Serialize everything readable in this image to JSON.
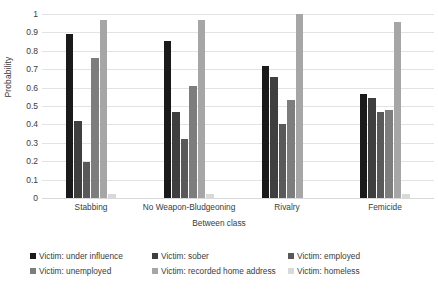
{
  "chart_data": {
    "type": "bar",
    "title": "",
    "xlabel": "Between class",
    "ylabel": "Probability",
    "ylim": [
      0,
      1
    ],
    "ytick_labels": [
      "0",
      "0.1",
      "0.2",
      "0.3",
      "0.4",
      "0.5",
      "0.6",
      "0.7",
      "0.8",
      "0.9",
      "1"
    ],
    "ytick_values": [
      0,
      0.1,
      0.2,
      0.3,
      0.4,
      0.5,
      0.6,
      0.7,
      0.8,
      0.9,
      1
    ],
    "grid": "horizontal",
    "legend_position": "bottom",
    "categories": [
      "Stabbing",
      "No Weapon-Bludgeoning",
      "Rivalry",
      "Femicide"
    ],
    "series": [
      {
        "name": "Victim: under influence",
        "color": "#1a1a1a",
        "values": [
          0.89,
          0.855,
          0.715,
          0.565
        ]
      },
      {
        "name": "Victim: sober",
        "color": "#3f3f3f",
        "values": [
          0.42,
          0.47,
          0.66,
          0.545
        ]
      },
      {
        "name": "Victim: employed",
        "color": "#595959",
        "values": [
          0.195,
          0.32,
          0.4,
          0.465
        ]
      },
      {
        "name": "Victim: unemployed",
        "color": "#7d7d7d",
        "values": [
          0.76,
          0.61,
          0.53,
          0.48
        ]
      },
      {
        "name": "Victim: recorded home address",
        "color": "#a6a6a6",
        "values": [
          0.97,
          0.965,
          1.0,
          0.955
        ]
      },
      {
        "name": "Victim: homeless",
        "color": "#d9d9d9",
        "values": [
          0.02,
          0.02,
          0.0,
          0.02
        ]
      }
    ]
  }
}
